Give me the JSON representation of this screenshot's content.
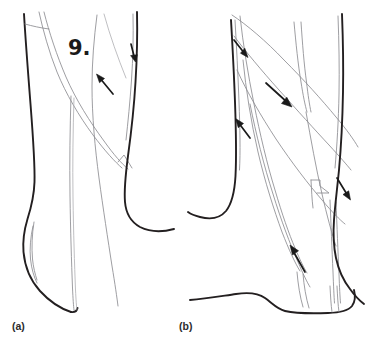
{
  "figure": {
    "background_color": "#ffffff",
    "width": 371,
    "height": 349,
    "style": "line-drawing",
    "number_label": "9.",
    "panels": [
      {
        "id": "a",
        "label": "(a)",
        "label_x": 12,
        "label_y": 329,
        "arrow_count": 2,
        "arrows": [
          {
            "name": "arrow-up-left",
            "direction": "up-left"
          },
          {
            "name": "arrow-down",
            "direction": "down"
          }
        ]
      },
      {
        "id": "b",
        "label": "(b)",
        "label_x": 179,
        "label_y": 329,
        "arrow_count": 4,
        "arrows": [
          {
            "name": "arrow-down-right-upper",
            "direction": "down-right"
          },
          {
            "name": "arrow-down-right-middle",
            "direction": "down-right"
          },
          {
            "name": "arrow-up-left-middle",
            "direction": "up-left"
          },
          {
            "name": "arrow-up-left-lower",
            "direction": "up-left"
          },
          {
            "name": "arrow-down-right-edge",
            "direction": "down-right"
          }
        ]
      }
    ],
    "colors": {
      "outline_dark": "#231f20",
      "outline_medium": "#3a3a3c",
      "detail_gray": "#8d8d91",
      "detail_light": "#a9a9ad",
      "arrow": "#1a1a1a",
      "text": "#1a1a1a"
    }
  }
}
